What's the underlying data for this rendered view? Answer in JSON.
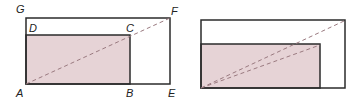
{
  "colors": {
    "shade": "#e6d3d6",
    "stroke": "#2b2b2b",
    "dash": "#9a7a80"
  },
  "figure_left": {
    "labels": {
      "G": "G",
      "D": "D",
      "C": "C",
      "F": "F",
      "A": "A",
      "B": "B",
      "E": "E"
    }
  },
  "figure_right": {
    "labels": {}
  }
}
